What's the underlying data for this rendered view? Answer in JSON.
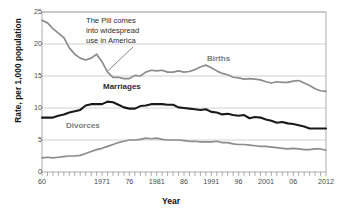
{
  "chart_data": {
    "type": "line",
    "title": "",
    "xlabel": "Year",
    "ylabel": "Rate, per 1,000 population",
    "xlim": [
      1960,
      2012
    ],
    "ylim": [
      0,
      25
    ],
    "yticks": [
      0,
      5,
      10,
      15,
      20,
      25
    ],
    "ytick_labels": [
      "0",
      "5",
      "10",
      "15",
      "20",
      "25"
    ],
    "xtick_positions": [
      1960,
      1971,
      1976,
      1981,
      1986,
      1991,
      1996,
      2001,
      2006,
      2012
    ],
    "xtick_labels": [
      "60",
      "1971",
      "76",
      "1981",
      "86",
      "1991",
      "96",
      "2001",
      "06",
      "2012"
    ],
    "grid": true,
    "grid_axis": "y",
    "legend_position": "inline-labels",
    "x": [
      1960,
      1961,
      1962,
      1963,
      1964,
      1965,
      1966,
      1967,
      1968,
      1969,
      1970,
      1971,
      1972,
      1973,
      1974,
      1975,
      1976,
      1977,
      1978,
      1979,
      1980,
      1981,
      1982,
      1983,
      1984,
      1985,
      1986,
      1987,
      1988,
      1989,
      1990,
      1991,
      1992,
      1993,
      1994,
      1995,
      1996,
      1997,
      1998,
      1999,
      2000,
      2001,
      2002,
      2003,
      2004,
      2005,
      2006,
      2007,
      2008,
      2009,
      2010,
      2011,
      2012
    ],
    "series": [
      {
        "name": "Births",
        "color": "#8c8c8c",
        "values": [
          23.7,
          23.3,
          22.4,
          21.7,
          21.0,
          19.4,
          18.4,
          17.8,
          17.5,
          17.8,
          18.4,
          17.2,
          15.6,
          14.8,
          14.8,
          14.6,
          14.6,
          15.1,
          15.0,
          15.6,
          15.9,
          15.8,
          15.9,
          15.6,
          15.6,
          15.8,
          15.6,
          15.7,
          16.0,
          16.4,
          16.7,
          16.3,
          15.8,
          15.4,
          15.2,
          14.8,
          14.7,
          14.5,
          14.6,
          14.5,
          14.4,
          14.1,
          13.9,
          14.1,
          14.0,
          14.0,
          14.2,
          14.3,
          13.9,
          13.5,
          13.0,
          12.7,
          12.6
        ]
      },
      {
        "name": "Marriages",
        "color": "#1a1a1a",
        "values": [
          8.5,
          8.5,
          8.5,
          8.8,
          9.0,
          9.3,
          9.5,
          9.7,
          10.4,
          10.6,
          10.6,
          10.6,
          11.0,
          10.9,
          10.5,
          10.1,
          9.9,
          9.9,
          10.3,
          10.4,
          10.6,
          10.6,
          10.6,
          10.5,
          10.5,
          10.1,
          10.0,
          9.9,
          9.8,
          9.7,
          9.8,
          9.4,
          9.3,
          9.0,
          9.1,
          8.9,
          8.8,
          8.9,
          8.4,
          8.6,
          8.5,
          8.2,
          8.0,
          7.7,
          7.8,
          7.6,
          7.5,
          7.3,
          7.1,
          6.8,
          6.8,
          6.8,
          6.8
        ]
      },
      {
        "name": "Divorces",
        "color": "#8c8c8c",
        "values": [
          2.2,
          2.3,
          2.2,
          2.3,
          2.4,
          2.5,
          2.5,
          2.6,
          2.9,
          3.2,
          3.5,
          3.7,
          4.0,
          4.3,
          4.6,
          4.8,
          5.0,
          5.0,
          5.1,
          5.3,
          5.2,
          5.3,
          5.1,
          5.0,
          5.0,
          5.0,
          4.9,
          4.8,
          4.8,
          4.7,
          4.7,
          4.7,
          4.8,
          4.6,
          4.6,
          4.4,
          4.3,
          4.3,
          4.2,
          4.1,
          4.0,
          4.0,
          3.9,
          3.8,
          3.7,
          3.6,
          3.7,
          3.6,
          3.5,
          3.5,
          3.6,
          3.6,
          3.4
        ]
      }
    ],
    "annotations": [
      {
        "text": "The Pill comes\ninto widespread\nuse in America",
        "points_to_year": 1972,
        "points_to_value": 15.6
      }
    ],
    "series_labels": [
      {
        "name": "Births"
      },
      {
        "name": "Marriages"
      },
      {
        "name": "Divorces"
      }
    ]
  }
}
